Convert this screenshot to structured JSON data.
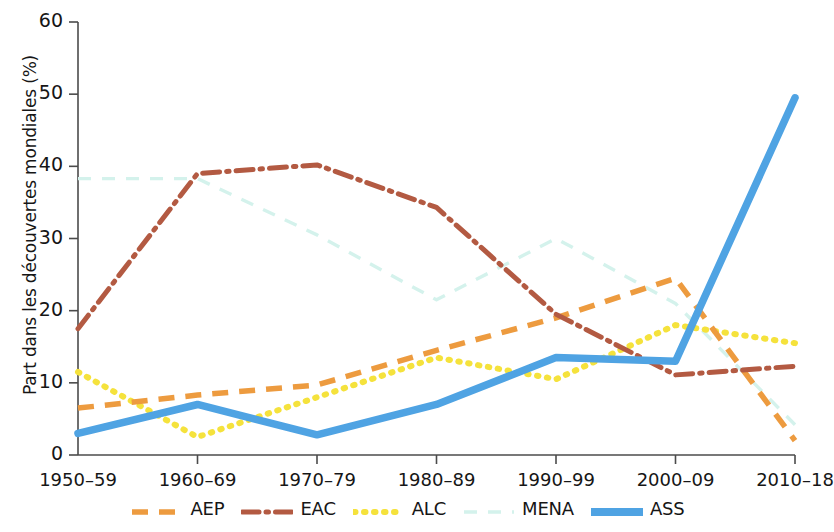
{
  "chart_data": {
    "type": "line",
    "title": "",
    "xlabel": "",
    "ylabel": "Part dans les découvertes mondiales (%)",
    "categories": [
      "1950–59",
      "1960–69",
      "1970–79",
      "1980–89",
      "1990–99",
      "2000–09",
      "2010–18"
    ],
    "ylim": [
      0,
      60
    ],
    "yticks": [
      0,
      10,
      20,
      30,
      40,
      50,
      60
    ],
    "grid": false,
    "legend_position": "bottom",
    "series": [
      {
        "name": "AEP",
        "color": "#ED9B3F",
        "style": "dashed",
        "values": [
          6.5,
          8.3,
          9.7,
          14.5,
          19.0,
          24.5,
          2.0
        ]
      },
      {
        "name": "EAC",
        "color": "#B35A42",
        "style": "dash-dot",
        "values": [
          17.5,
          39.0,
          40.2,
          34.3,
          19.5,
          11.1,
          12.3
        ]
      },
      {
        "name": "ALC",
        "color": "#F5E23C",
        "style": "dotted",
        "values": [
          11.5,
          2.5,
          8.0,
          13.5,
          10.5,
          18.0,
          15.5
        ]
      },
      {
        "name": "MENA",
        "color": "#D4F2EC",
        "style": "dashed-light",
        "values": [
          38.3,
          38.3,
          30.5,
          21.5,
          30.0,
          21.0,
          4.2
        ]
      },
      {
        "name": "ASS",
        "color": "#4FA3E3",
        "style": "solid",
        "values": [
          3.0,
          7.0,
          2.8,
          7.0,
          13.5,
          13.0,
          49.5
        ]
      }
    ]
  },
  "axes": {
    "tick_color": "#4b4b4b",
    "axis_color": "#4b4b4b"
  }
}
